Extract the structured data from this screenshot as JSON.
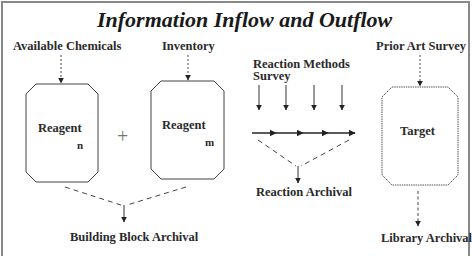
{
  "title": "Information Inflow and Outflow",
  "sources": {
    "available_chemicals": "Available Chemicals",
    "inventory": "Inventory",
    "reaction_methods_line1": "Reaction Methods",
    "reaction_methods_line2": "Survey",
    "prior_art_survey": "Prior Art Survey"
  },
  "boxes": [
    {
      "label": "Reagent",
      "subscript": "n"
    },
    {
      "label": "Reagent",
      "subscript": "m"
    },
    {
      "label": "Target",
      "subscript": ""
    }
  ],
  "operator": "+",
  "outputs": {
    "building_block_archival": "Building Block Archival",
    "reaction_archival": "Reaction Archival",
    "library_archival": "Library Archival"
  },
  "colors": {
    "stroke": "#333333",
    "frame": "#888888",
    "text": "#2a2a2a"
  }
}
